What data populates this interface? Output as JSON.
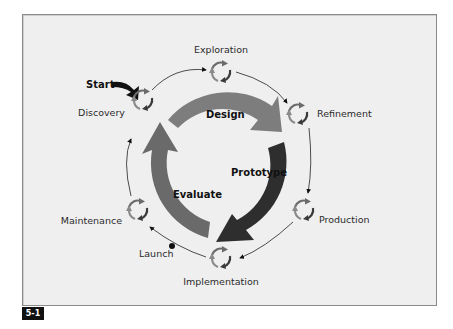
{
  "figure": {
    "badge": "5-1",
    "start_label": "Start",
    "colors": {
      "design_arrow": "#7a7a7a",
      "prototype_arrow": "#2e2e2e",
      "evaluate_arrow": "#6a6a6a",
      "node_icon": "#6b6b6b",
      "background": "#efefef"
    },
    "core_cycle": [
      {
        "label": "Design"
      },
      {
        "label": "Prototype"
      },
      {
        "label": "Evaluate"
      }
    ],
    "nodes": [
      {
        "label": "Exploration"
      },
      {
        "label": "Refinement"
      },
      {
        "label": "Production"
      },
      {
        "label": "Implementation"
      },
      {
        "label": "Maintenance"
      },
      {
        "label": "Discovery"
      }
    ],
    "milestone": {
      "label": "Launch"
    }
  }
}
